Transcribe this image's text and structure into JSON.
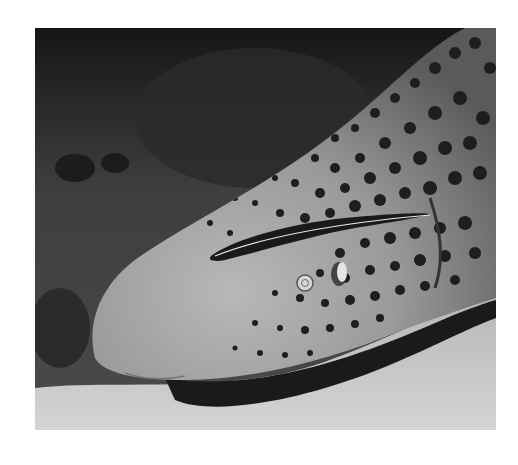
{
  "image": {
    "subject": "Leopard shark head resting on sandy sea floor with a remora attached",
    "style": "grayscale photograph",
    "colors": {
      "background": "#ffffff",
      "reef": "#3a3a3a",
      "shark_skin": "#9a9a9a",
      "spots": "#1e1e1e",
      "sand": "#c9c9c9",
      "shadow": "#1a1a1a"
    }
  }
}
